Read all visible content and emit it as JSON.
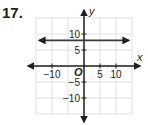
{
  "problem": {
    "number": "17."
  },
  "chart_data": {
    "type": "line",
    "title": "",
    "xlabel": "x",
    "ylabel": "y",
    "origin_label": "O",
    "xlim": [
      -15,
      15
    ],
    "ylim": [
      -15,
      15
    ],
    "grid": true,
    "grid_step": 5,
    "x_ticks": [
      {
        "value": -10,
        "label": "−10"
      },
      {
        "value": 5,
        "label": "5"
      },
      {
        "value": 10,
        "label": "10"
      }
    ],
    "y_ticks": [
      {
        "value": 10,
        "label": "10"
      },
      {
        "value": 5,
        "label": "5"
      },
      {
        "value": -5,
        "label": "−5"
      },
      {
        "value": -10,
        "label": "−10"
      }
    ],
    "series": [
      {
        "name": "horizontal line",
        "kind": "line",
        "y": 8,
        "x_range": [
          -14,
          14
        ],
        "arrows": true
      }
    ],
    "colors": {
      "axis": "#231f20",
      "grid": "#d9d9d9",
      "line": "#3a3a3a"
    }
  }
}
